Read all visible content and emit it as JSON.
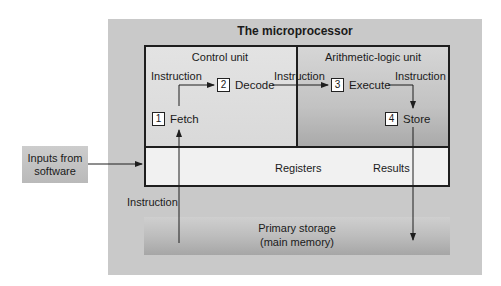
{
  "diagram": {
    "title": "The microprocessor",
    "control_unit": {
      "label": "Control unit"
    },
    "alu": {
      "label": "Arithmetic-logic unit"
    },
    "steps": [
      {
        "number": "1",
        "label": "Fetch"
      },
      {
        "number": "2",
        "label": "Decode"
      },
      {
        "number": "3",
        "label": "Execute"
      },
      {
        "number": "4",
        "label": "Store"
      }
    ],
    "edge_labels": {
      "fetch_to_decode": "Instruction",
      "decode_to_execute": "Instruction",
      "execute_to_store": "Instruction",
      "storage_to_fetch": "Instruction",
      "store_to_storage": "Results"
    },
    "registers": {
      "label": "Registers"
    },
    "primary_storage": {
      "line1": "Primary storage",
      "line2": "(main memory)"
    },
    "inputs": {
      "line1": "Inputs from",
      "line2": "software"
    },
    "colors": {
      "outer_box": "#c9c9c9",
      "control_unit_fill": "#e0e0e0",
      "alu_fill": "#bdbdbd",
      "registers_fill": "#f1f1f1",
      "storage_fill": "#b8b8b8",
      "line": "#1e1e1e"
    }
  }
}
